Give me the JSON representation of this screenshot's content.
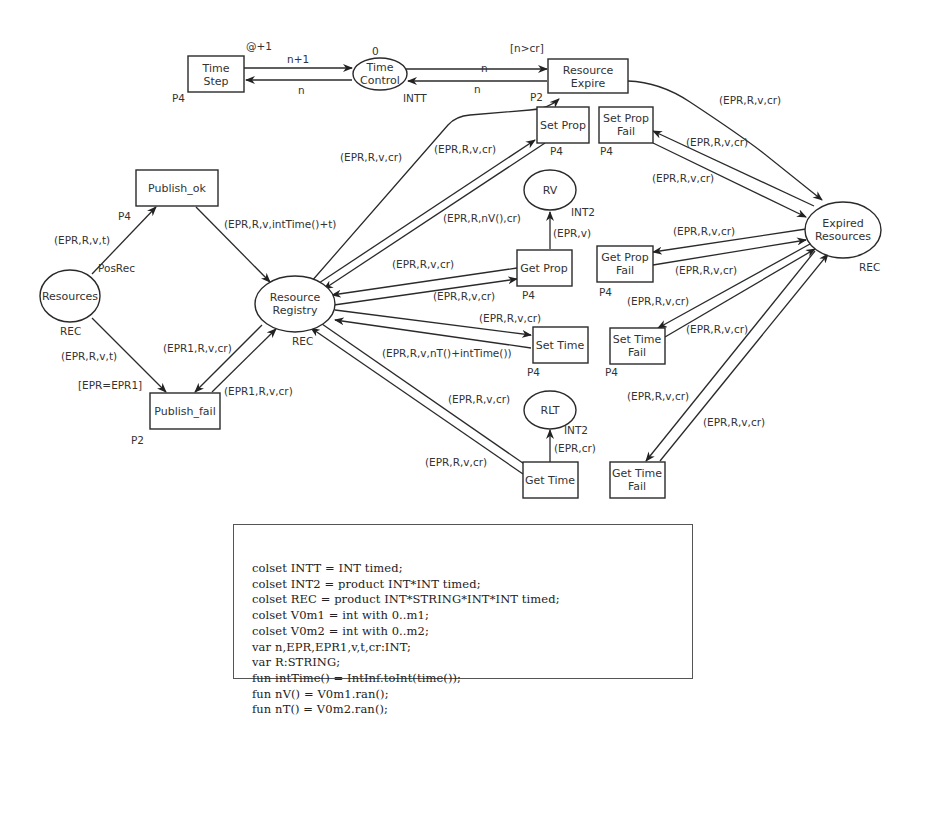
{
  "places": {
    "time_control": {
      "label1": "Time",
      "label2": "Control",
      "type": "INTT",
      "initial": "0"
    },
    "resources": {
      "label": "Resources",
      "type": "REC"
    },
    "resource_registry": {
      "label1": "Resource",
      "label2": "Registry",
      "type": "REC"
    },
    "rv": {
      "label": "RV",
      "type": "INT2"
    },
    "rlt": {
      "label": "RLT",
      "type": "INT2"
    },
    "expired_resources": {
      "label1": "Expired",
      "label2": "Resources",
      "type": "REC"
    }
  },
  "transitions": {
    "time_step": {
      "label1": "Time",
      "label2": "Step",
      "priority": "P4",
      "delay": "@+1"
    },
    "resource_expire": {
      "label1": "Resource",
      "label2": "Expire",
      "priority": "P2",
      "guard": "[n>cr]"
    },
    "publish_ok": {
      "label": "Publish_ok",
      "priority": "P4"
    },
    "publish_fail": {
      "label": "Publish_fail",
      "priority": "P2",
      "guard": "[EPR=EPR1]"
    },
    "set_prop": {
      "label": "Set Prop",
      "priority": "P4"
    },
    "set_prop_fail": {
      "label1": "Set Prop",
      "label2": "Fail",
      "priority": "P4"
    },
    "get_prop": {
      "label": "Get Prop",
      "priority": "P4"
    },
    "get_prop_fail": {
      "label1": "Get Prop",
      "label2": "Fail",
      "priority": "P4"
    },
    "set_time": {
      "label": "Set Time",
      "priority": "P4"
    },
    "set_time_fail": {
      "label1": "Set Time",
      "label2": "Fail",
      "priority": "P4"
    },
    "get_time": {
      "label": "Get Time",
      "priority": "P4"
    },
    "get_time_fail": {
      "label1": "Get Time",
      "label2": "Fail",
      "priority": "P4"
    }
  },
  "arcs": {
    "timestep_to_timecontrol": "n+1",
    "timecontrol_to_timestep": "n",
    "timecontrol_to_expire": "n",
    "expire_to_timecontrol": "n",
    "resources_to_publish_ok": "(EPR,R,v,t)",
    "resources_fusion": "PosRec",
    "publish_ok_to_registry": "(EPR,R,v,intTime()+t)",
    "resources_to_publish_fail": "(EPR,R,v,t)",
    "registry_to_publish_fail": "(EPR1,R,v,cr)",
    "publish_fail_to_registry": "(EPR1,R,v,cr)",
    "registry_to_expire": "(EPR,R,v,cr)",
    "registry_to_set_prop": "(EPR,R,v,cr)",
    "set_prop_to_registry": "(EPR,R,nV(),cr)",
    "get_prop_to_rv": "(EPR,v)",
    "get_prop_to_registry": "(EPR,R,v,cr)",
    "registry_to_get_prop": "(EPR,R,v,cr)",
    "registry_to_set_time": "(EPR,R,v,cr)",
    "set_time_to_registry": "(EPR,R,v,nT()+intTime())",
    "registry_to_get_time": "(EPR,R,v,cr)",
    "get_time_to_registry": "(EPR,R,v,cr)",
    "get_time_to_rlt": "(EPR,cr)",
    "expire_to_expired": "(EPR,R,v,cr)",
    "expired_to_set_prop_fail": "(EPR,R,v,cr)",
    "set_prop_fail_to_expired": "(EPR,R,v,cr)",
    "expired_to_get_prop_fail": "(EPR,R,v,cr)",
    "get_prop_fail_to_expired": "(EPR,R,v,cr)",
    "expired_to_set_time_fail": "(EPR,R,v,cr)",
    "set_time_fail_to_expired": "(EPR,R,v,cr)",
    "expired_to_get_time_fail": "(EPR,R,v,cr)",
    "get_time_fail_to_expired": "(EPR,R,v,cr)"
  },
  "declarations": [
    "colset INTT = INT timed;",
    "colset INT2 = product INT*INT timed;",
    "colset REC = product INT*STRING*INT*INT timed;",
    "colset V0m1 = int with 0..m1;",
    "colset V0m2 = int with 0..m2;",
    "var n,EPR,EPR1,v,t,cr:INT;",
    "var R:STRING;",
    "fun intTime() = IntInf.toInt(time());",
    "fun nV() = V0m1.ran();",
    "fun nT() = V0m2.ran();"
  ]
}
